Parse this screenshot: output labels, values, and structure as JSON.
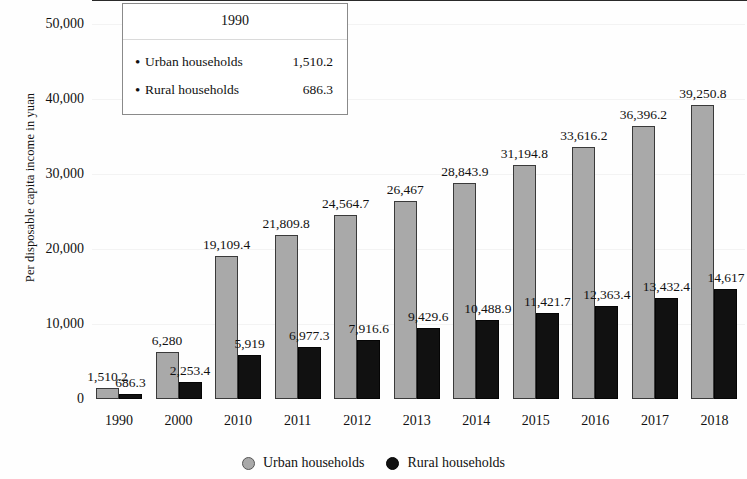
{
  "chart_data": {
    "type": "bar",
    "title": "",
    "xlabel": "",
    "ylabel": "Per disposable capita income in yuan",
    "ylim": [
      0,
      50000
    ],
    "yticks": [
      "0",
      "10,000",
      "20,000",
      "30,000",
      "40,000",
      "50,000"
    ],
    "ytick_values": [
      0,
      10000,
      20000,
      30000,
      40000,
      50000
    ],
    "grid": true,
    "legend_position": "bottom-center",
    "categories": [
      "1990",
      "2000",
      "2010",
      "2011",
      "2012",
      "2013",
      "2014",
      "2015",
      "2016",
      "2017",
      "2018"
    ],
    "series": [
      {
        "name": "Urban households",
        "color": "#a9a9a9",
        "values": [
          1510.2,
          6280,
          19109.4,
          21809.8,
          24564.7,
          26467,
          28843.9,
          31194.8,
          33616.2,
          36396.2,
          39250.8
        ],
        "labels": [
          "1,510.2",
          "6,280",
          "19,109.4",
          "21,809.8",
          "24,564.7",
          "26,467",
          "28,843.9",
          "31,194.8",
          "33,616.2",
          "36,396.2",
          "39,250.8"
        ]
      },
      {
        "name": "Rural households",
        "color": "#111111",
        "values": [
          686.3,
          2253.4,
          5919,
          6977.3,
          7916.6,
          9429.6,
          10488.9,
          11421.7,
          12363.4,
          13432.4,
          14617
        ],
        "labels": [
          "686.3",
          "2,253.4",
          "5,919",
          "6,977.3",
          "7,916.6",
          "9,429.6",
          "10,488.9",
          "11,421.7",
          "12,363.4",
          "13,432.4",
          "14,617"
        ]
      }
    ]
  },
  "tooltip": {
    "header": "1990",
    "rows": [
      {
        "bullet": "bullet-icon",
        "name": "Urban households",
        "value": "1,510.2"
      },
      {
        "bullet": "bullet-icon",
        "name": "Rural households",
        "value": "686.3"
      }
    ]
  },
  "legend": {
    "items": [
      {
        "label": "Urban households",
        "marker": "gray-circle-icon"
      },
      {
        "label": "Rural households",
        "marker": "black-circle-icon"
      }
    ]
  }
}
